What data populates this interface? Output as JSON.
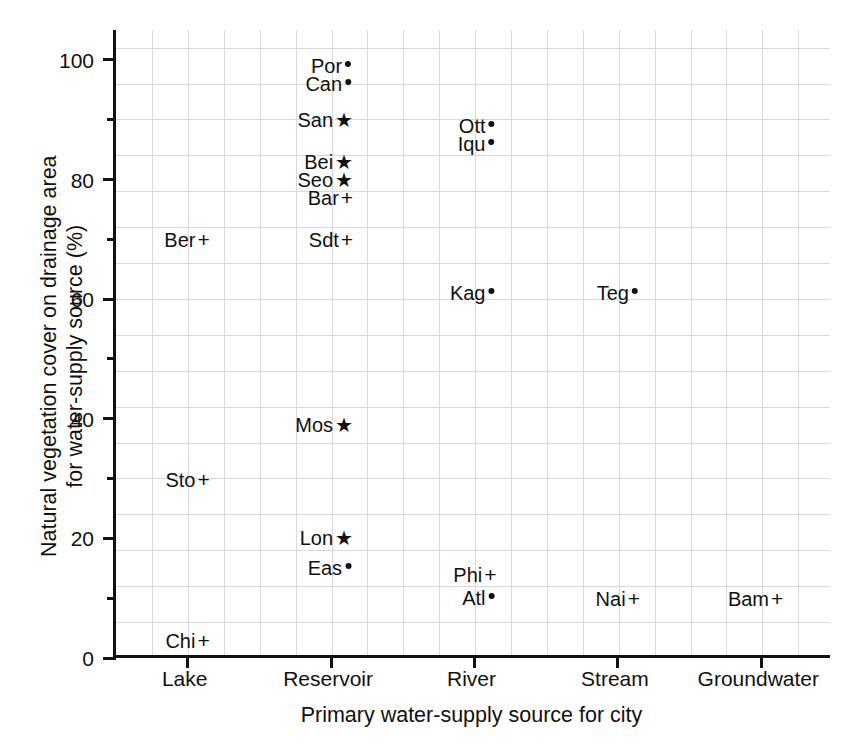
{
  "chart_data": {
    "type": "scatter",
    "title": "",
    "xlabel": "Primary water-supply source for city",
    "ylabel_line1": "Natural vegetation cover on drainage area",
    "ylabel_line2": "for water-supply source (%)",
    "categories": [
      "Lake",
      "Reservoir",
      "River",
      "Stream",
      "Groundwater"
    ],
    "ylim": [
      0,
      105
    ],
    "yticks_major": [
      0,
      20,
      40,
      60,
      80,
      100
    ],
    "yticks_minor": [
      10,
      30,
      50,
      70,
      90
    ],
    "ytick_labels": [
      "0",
      "20",
      "40",
      "60",
      "80",
      "100"
    ],
    "grid": true,
    "legend": "none",
    "marker_glyphs": {
      "dot": "•",
      "star": "★",
      "plus": "+"
    },
    "points": [
      {
        "label": "Por",
        "marker": "dot",
        "category": "Reservoir",
        "x": 1,
        "y": 99
      },
      {
        "label": "Can",
        "marker": "dot",
        "category": "Reservoir",
        "x": 1,
        "y": 96
      },
      {
        "label": "San",
        "marker": "star",
        "category": "Reservoir",
        "x": 1,
        "y": 90
      },
      {
        "label": "Ott",
        "marker": "dot",
        "category": "River",
        "x": 2,
        "y": 89
      },
      {
        "label": "Iqu",
        "marker": "dot",
        "category": "River",
        "x": 2,
        "y": 86
      },
      {
        "label": "Bei",
        "marker": "star",
        "category": "Reservoir",
        "x": 1,
        "y": 83
      },
      {
        "label": "Seo",
        "marker": "star",
        "category": "Reservoir",
        "x": 1,
        "y": 80
      },
      {
        "label": "Bar",
        "marker": "plus",
        "category": "Reservoir",
        "x": 1,
        "y": 77
      },
      {
        "label": "Ber",
        "marker": "plus",
        "category": "Lake",
        "x": 0,
        "y": 70
      },
      {
        "label": "Sdt",
        "marker": "plus",
        "category": "Reservoir",
        "x": 1,
        "y": 70
      },
      {
        "label": "Kag",
        "marker": "dot",
        "category": "River",
        "x": 2,
        "y": 61
      },
      {
        "label": "Teg",
        "marker": "dot",
        "category": "Stream",
        "x": 3,
        "y": 61
      },
      {
        "label": "Mos",
        "marker": "star",
        "category": "Reservoir",
        "x": 1,
        "y": 39
      },
      {
        "label": "Sto",
        "marker": "plus",
        "category": "Lake",
        "x": 0,
        "y": 30
      },
      {
        "label": "Lon",
        "marker": "star",
        "category": "Reservoir",
        "x": 1,
        "y": 20
      },
      {
        "label": "Eas",
        "marker": "dot",
        "category": "Reservoir",
        "x": 1,
        "y": 15
      },
      {
        "label": "Phi",
        "marker": "plus",
        "category": "River",
        "x": 2,
        "y": 14
      },
      {
        "label": "Atl",
        "marker": "dot",
        "category": "River",
        "x": 2,
        "y": 10
      },
      {
        "label": "Nai",
        "marker": "plus",
        "category": "Stream",
        "x": 3,
        "y": 10
      },
      {
        "label": "Bam",
        "marker": "plus",
        "category": "Groundwater",
        "x": 4,
        "y": 10
      },
      {
        "label": "Chi",
        "marker": "plus",
        "category": "Lake",
        "x": 0,
        "y": 3
      }
    ]
  },
  "colors": {
    "axis": "#111111",
    "grid": "#d8d8de",
    "text": "#111111",
    "background": "#ffffff"
  }
}
